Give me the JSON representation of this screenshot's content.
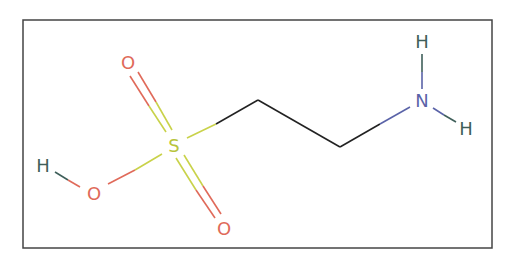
{
  "molecule": {
    "name": "taurine-structure",
    "atoms": [
      {
        "id": "H1",
        "label": "H",
        "x": 43,
        "y": 165,
        "color": "#3f5f5a"
      },
      {
        "id": "O1",
        "label": "O",
        "x": 94,
        "y": 193,
        "color": "#e06a5a"
      },
      {
        "id": "S",
        "label": "S",
        "x": 174,
        "y": 145,
        "color": "#b8c43c"
      },
      {
        "id": "O2",
        "label": "O",
        "x": 128,
        "y": 62,
        "color": "#e06a5a"
      },
      {
        "id": "O3",
        "label": "O",
        "x": 224,
        "y": 228,
        "color": "#e06a5a"
      },
      {
        "id": "N",
        "label": "N",
        "x": 422,
        "y": 100,
        "color": "#5a63a8"
      },
      {
        "id": "H2",
        "label": "H",
        "x": 422,
        "y": 41,
        "color": "#3f5f5a"
      },
      {
        "id": "H3",
        "label": "H",
        "x": 466,
        "y": 128,
        "color": "#3f5f5a"
      }
    ],
    "colors": {
      "frame": "#444444",
      "carbon_bond": "#222222",
      "oxygen": "#e06a5a",
      "sulfur": "#c9d24a",
      "nitrogen": "#5a63a8",
      "hydrogen": "#3f5f5a"
    }
  }
}
